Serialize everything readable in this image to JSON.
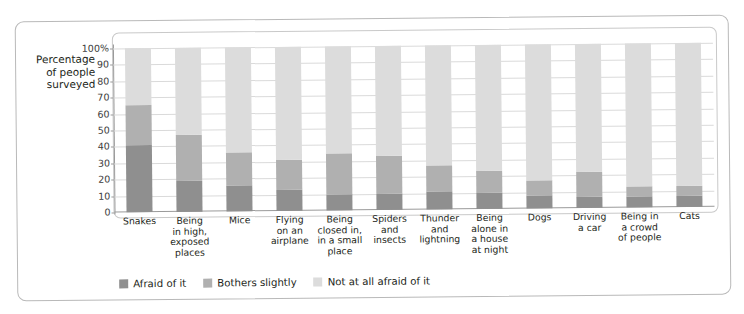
{
  "chart_data": {
    "type": "bar",
    "subtype": "stacked-bar-100",
    "title": "",
    "xlabel": "",
    "ylabel": "Percentage of people surveyed",
    "ylabel_lines": [
      "Percentage",
      "of people",
      "surveyed"
    ],
    "ylim": [
      0,
      100
    ],
    "yticks": [
      0,
      10,
      20,
      30,
      40,
      50,
      60,
      70,
      80,
      90,
      100
    ],
    "ytick_labels": [
      "0",
      "10",
      "20",
      "30",
      "40",
      "50",
      "60",
      "70",
      "80",
      "90",
      "100%"
    ],
    "grid": true,
    "legend_position": "bottom-left",
    "categories": [
      "Snakes",
      "Being in high, exposed places",
      "Mice",
      "Flying on an airplane",
      "Being closed in, in a small place",
      "Spiders and insects",
      "Thunder and lightning",
      "Being alone in a house at night",
      "Dogs",
      "Driving a car",
      "Being in a crowd of people",
      "Cats"
    ],
    "category_lines": [
      [
        "Snakes"
      ],
      [
        "Being",
        "in high,",
        "exposed",
        "places"
      ],
      [
        "Mice"
      ],
      [
        "Flying",
        "on an",
        "airplane"
      ],
      [
        "Being",
        "closed in,",
        "in a small",
        "place"
      ],
      [
        "Spiders",
        "and",
        "insects"
      ],
      [
        "Thunder",
        "and",
        "lightning"
      ],
      [
        "Being",
        "alone in",
        "a house",
        "at night"
      ],
      [
        "Dogs"
      ],
      [
        "Driving",
        "a car"
      ],
      [
        "Being in",
        "a crowd",
        "of people"
      ],
      [
        "Cats"
      ]
    ],
    "series": [
      {
        "name": "Afraid of it",
        "color": "#8f8f8f",
        "values": [
          41,
          19,
          16,
          13,
          10,
          10,
          11,
          10,
          8,
          7,
          7,
          7
        ]
      },
      {
        "name": "Bothers slightly",
        "color": "#b0b0b0",
        "values": [
          24,
          28,
          20,
          18,
          25,
          23,
          16,
          13,
          9,
          15,
          6,
          6
        ]
      },
      {
        "name": "Not at all afraid of it",
        "color": "#dcdcdc",
        "values": [
          35,
          53,
          64,
          69,
          65,
          67,
          73,
          77,
          83,
          78,
          87,
          87
        ]
      }
    ],
    "cumulative_tops": {
      "afraid": [
        41,
        19,
        16,
        13,
        10,
        10,
        11,
        10,
        8,
        7,
        7,
        7
      ],
      "bothers": [
        65,
        47,
        36,
        31,
        35,
        33,
        27,
        23,
        17,
        22,
        13,
        13
      ]
    }
  },
  "legend": {
    "items": [
      {
        "label": "Afraid of it",
        "color": "#8f8f8f"
      },
      {
        "label": "Bothers slightly",
        "color": "#b0b0b0"
      },
      {
        "label": "Not at all afraid of it",
        "color": "#dcdcdc"
      }
    ]
  }
}
